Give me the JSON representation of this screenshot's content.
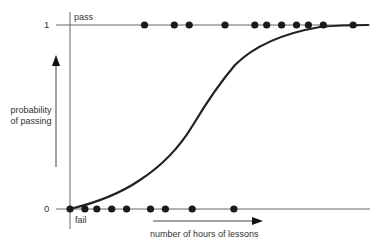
{
  "chart_data": {
    "type": "scatter",
    "title": "",
    "xlabel": "number of hours of lessons",
    "ylabel": "probability of passing",
    "y_ticks": [
      {
        "value": 0,
        "label": "0"
      },
      {
        "value": 1,
        "label": "1"
      }
    ],
    "annotations": {
      "top": "pass",
      "bottom": "fail"
    },
    "grid": false,
    "legend": null,
    "series": [
      {
        "name": "pass outcomes",
        "y": 1,
        "x_rel": [
          0.25,
          0.35,
          0.4,
          0.52,
          0.62,
          0.66,
          0.71,
          0.76,
          0.8,
          0.85,
          0.95
        ]
      },
      {
        "name": "fail outcomes",
        "y": 0,
        "x_rel": [
          0.0,
          0.05,
          0.09,
          0.14,
          0.19,
          0.27,
          0.32,
          0.41,
          0.55
        ]
      },
      {
        "name": "logistic curve",
        "kind": "line",
        "points": [
          [
            0.0,
            0.0
          ],
          [
            0.1,
            0.06
          ],
          [
            0.21,
            0.14
          ],
          [
            0.33,
            0.32
          ],
          [
            0.39,
            0.43
          ],
          [
            0.44,
            0.57
          ],
          [
            0.52,
            0.74
          ],
          [
            0.6,
            0.83
          ],
          [
            0.69,
            0.91
          ],
          [
            0.8,
            0.97
          ],
          [
            1.0,
            1.0
          ]
        ]
      }
    ]
  },
  "labels": {
    "y_one": "1",
    "y_zero": "0",
    "pass": "pass",
    "fail": "fail",
    "ylabel_line1": "probability",
    "ylabel_line2": "of passing",
    "xlabel": "number of hours of lessons"
  },
  "colors": {
    "ink": "#222222",
    "axis": "#555555",
    "text": "#333333"
  }
}
